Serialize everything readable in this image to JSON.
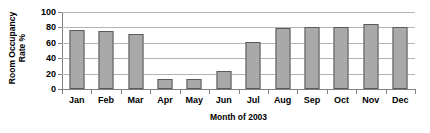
{
  "chart_data": {
    "type": "bar",
    "title": "",
    "xlabel": "Month of 2003",
    "ylabel": "Room Occupancy Rate %",
    "ylabel_line1": "Room Occupancy",
    "ylabel_line2": "Rate %",
    "categories": [
      "Jan",
      "Feb",
      "Mar",
      "Apr",
      "May",
      "Jun",
      "Jul",
      "Aug",
      "Sep",
      "Oct",
      "Nov",
      "Dec"
    ],
    "values": [
      77,
      75,
      71,
      13,
      13,
      24,
      61,
      79,
      80,
      81,
      85,
      80
    ],
    "ylim": [
      0,
      100
    ],
    "ytick_labels": [
      "0",
      "20",
      "40",
      "60",
      "80",
      "100"
    ],
    "ytick_values": [
      0,
      20,
      40,
      60,
      80,
      100
    ],
    "grid": true,
    "legend": "none",
    "bar_color": "#a9a9a9",
    "bar_border_color": "#5a5a5a",
    "grid_color": "#b4b4b4",
    "axis_color": "#808080"
  }
}
